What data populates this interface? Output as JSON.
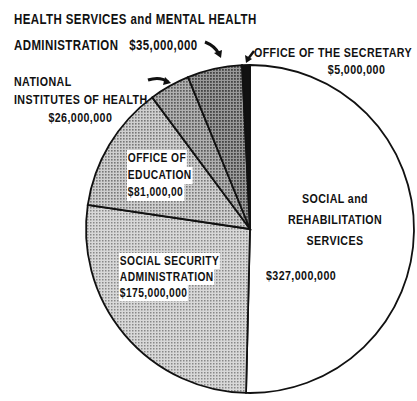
{
  "chart_data": {
    "type": "pie",
    "title": "",
    "start": "12 o'clock",
    "direction": "clockwise",
    "slices": [
      {
        "name": "SOCIAL and REHABILITATION SERVICES",
        "value": 327000000,
        "amount_label": "$327,000,000",
        "fill": "#ffffff"
      },
      {
        "name": "SOCIAL SECURITY ADMINISTRATION",
        "value": 175000000,
        "amount_label": "$175,000,000",
        "fill": "#c9c9c9"
      },
      {
        "name": "OFFICE OF EDUCATION",
        "value": 81000000,
        "amount_label": "$81,000,00",
        "fill": "#b8b8b8"
      },
      {
        "name": "NATIONAL INSTITUTES OF HEALTH",
        "value": 26000000,
        "amount_label": "$26,000,000",
        "fill": "#9a9a9a"
      },
      {
        "name": "HEALTH SERVICES and MENTAL HEALTH ADMINISTRATION",
        "value": 35000000,
        "amount_label": "$35,000,000",
        "fill": "#7c7c7c"
      },
      {
        "name": "OFFICE OF THE SECRETARY",
        "value": 5000000,
        "amount_label": "$5,000,000",
        "fill": "#111111"
      }
    ]
  },
  "labels": {
    "hsmha": {
      "line1": "HEALTH SERVICES and MENTAL HEALTH",
      "line2": "ADMINISTRATION",
      "amount": "$35,000,000"
    },
    "secretary": {
      "line1": "OFFICE OF THE SECRETARY",
      "amount": "$5,000,000"
    },
    "nih": {
      "line1": "NATIONAL",
      "line2": "INSTITUTES OF HEALTH",
      "amount": "$26,000,000"
    },
    "education": {
      "line1": "OFFICE OF",
      "line2": "EDUCATION",
      "amount": "$81,000,00"
    },
    "ssa": {
      "line1": "SOCIAL SECURITY",
      "line2": "ADMINISTRATION",
      "amount": "$175,000,000"
    },
    "srs": {
      "line1": "SOCIAL and",
      "line2": "REHABILITATION",
      "line3": "SERVICES",
      "amount": "$327,000,000"
    }
  }
}
